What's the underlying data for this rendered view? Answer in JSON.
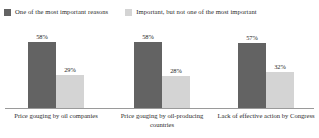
{
  "chart_data": {
    "type": "bar",
    "title": "",
    "subtitle": "",
    "xlabel": "",
    "ylabel": "",
    "ylim": [
      0,
      100
    ],
    "grid": false,
    "legend_position": "top",
    "orientation": "vertical",
    "grouping": "grouped",
    "value_suffix": "%",
    "categories": [
      "Price gouging by oil companies",
      "Price gouging by oil-producing countries",
      "Lack of effective action by Congress"
    ],
    "series": [
      {
        "name": "One of the most important reasons",
        "color": "#636363",
        "values": [
          58,
          58,
          57
        ],
        "labels": [
          "58%",
          "58%",
          "57%"
        ]
      },
      {
        "name": "Important, but not one of the most important",
        "color": "#d4d4d4",
        "values": [
          29,
          28,
          32
        ],
        "labels": [
          "29%",
          "28%",
          "32%"
        ]
      }
    ]
  },
  "legend": {
    "items": [
      {
        "label": "One of the most important reasons",
        "color": "#636363"
      },
      {
        "label": "Important, but not one of the most important",
        "color": "#d4d4d4"
      }
    ]
  },
  "axis": {
    "baseline_color": "#9a9a9a"
  }
}
